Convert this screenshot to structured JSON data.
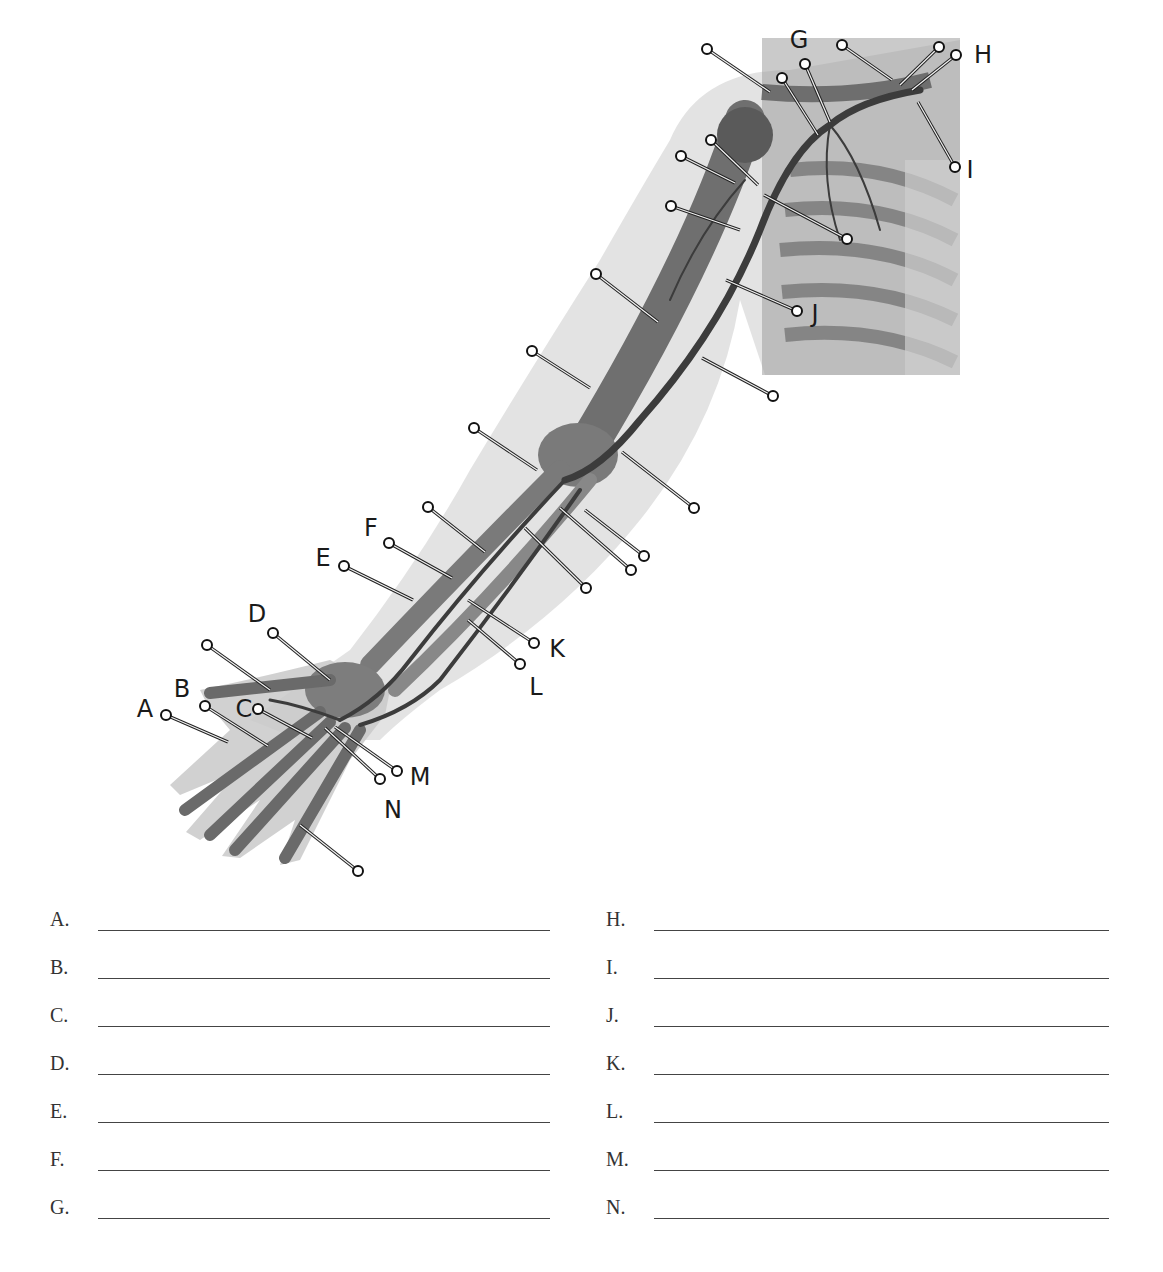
{
  "figure": {
    "callouts": [
      {
        "letter": "A",
        "label_x": 145,
        "label_y": 717,
        "pin_x": 166,
        "pin_y": 715,
        "end_x": 228,
        "end_y": 742
      },
      {
        "letter": "B",
        "label_x": 182,
        "label_y": 697,
        "pin_x": 205,
        "pin_y": 706,
        "end_x": 268,
        "end_y": 746
      },
      {
        "letter": "C",
        "label_x": 244,
        "label_y": 717,
        "pin_x": 258,
        "pin_y": 709,
        "end_x": 312,
        "end_y": 738
      },
      {
        "letter": "D",
        "label_x": 257,
        "label_y": 622,
        "pin_x": 273,
        "pin_y": 633,
        "end_x": 330,
        "end_y": 680
      },
      {
        "letter": "E",
        "label_x": 323,
        "label_y": 566,
        "pin_x": 344,
        "pin_y": 566,
        "end_x": 413,
        "end_y": 600
      },
      {
        "letter": "F",
        "label_x": 371,
        "label_y": 536,
        "pin_x": 389,
        "pin_y": 543,
        "end_x": 452,
        "end_y": 578
      },
      {
        "letter": "G",
        "label_x": 799,
        "label_y": 48,
        "pin_x": 805,
        "pin_y": 64,
        "end_x": 830,
        "end_y": 122
      },
      {
        "letter": "H",
        "label_x": 983,
        "label_y": 63,
        "pin_x": 956,
        "pin_y": 55,
        "end_x": 912,
        "end_y": 90
      },
      {
        "letter": "I",
        "label_x": 970,
        "label_y": 178,
        "pin_x": 955,
        "pin_y": 167,
        "end_x": 918,
        "end_y": 102
      },
      {
        "letter": "J",
        "label_x": 815,
        "label_y": 322,
        "pin_x": 797,
        "pin_y": 311,
        "end_x": 726,
        "end_y": 280
      },
      {
        "letter": "K",
        "label_x": 557,
        "label_y": 657,
        "pin_x": 534,
        "pin_y": 643,
        "end_x": 468,
        "end_y": 600
      },
      {
        "letter": "L",
        "label_x": 536,
        "label_y": 695,
        "pin_x": 520,
        "pin_y": 664,
        "end_x": 468,
        "end_y": 620
      },
      {
        "letter": "M",
        "label_x": 420,
        "label_y": 785,
        "pin_x": 397,
        "pin_y": 771,
        "end_x": 335,
        "end_y": 727
      },
      {
        "letter": "N",
        "label_x": 393,
        "label_y": 818,
        "pin_x": 380,
        "pin_y": 779,
        "end_x": 325,
        "end_y": 728
      }
    ],
    "unlabeled_pins": [
      {
        "pin_x": 707,
        "pin_y": 49,
        "end_x": 770,
        "end_y": 92
      },
      {
        "pin_x": 782,
        "pin_y": 78,
        "end_x": 818,
        "end_y": 135
      },
      {
        "pin_x": 842,
        "pin_y": 45,
        "end_x": 892,
        "end_y": 80
      },
      {
        "pin_x": 939,
        "pin_y": 47,
        "end_x": 900,
        "end_y": 85
      },
      {
        "pin_x": 711,
        "pin_y": 140,
        "end_x": 758,
        "end_y": 185
      },
      {
        "pin_x": 681,
        "pin_y": 156,
        "end_x": 735,
        "end_y": 183
      },
      {
        "pin_x": 847,
        "pin_y": 239,
        "end_x": 764,
        "end_y": 195
      },
      {
        "pin_x": 671,
        "pin_y": 206,
        "end_x": 740,
        "end_y": 230
      },
      {
        "pin_x": 596,
        "pin_y": 274,
        "end_x": 658,
        "end_y": 322
      },
      {
        "pin_x": 773,
        "pin_y": 396,
        "end_x": 702,
        "end_y": 358
      },
      {
        "pin_x": 532,
        "pin_y": 351,
        "end_x": 590,
        "end_y": 388
      },
      {
        "pin_x": 474,
        "pin_y": 428,
        "end_x": 537,
        "end_y": 470
      },
      {
        "pin_x": 694,
        "pin_y": 508,
        "end_x": 622,
        "end_y": 452
      },
      {
        "pin_x": 428,
        "pin_y": 507,
        "end_x": 485,
        "end_y": 552
      },
      {
        "pin_x": 644,
        "pin_y": 556,
        "end_x": 585,
        "end_y": 510
      },
      {
        "pin_x": 631,
        "pin_y": 570,
        "end_x": 560,
        "end_y": 508
      },
      {
        "pin_x": 586,
        "pin_y": 588,
        "end_x": 525,
        "end_y": 528
      },
      {
        "pin_x": 207,
        "pin_y": 645,
        "end_x": 270,
        "end_y": 690
      },
      {
        "pin_x": 358,
        "pin_y": 871,
        "end_x": 300,
        "end_y": 825
      }
    ]
  },
  "answers": {
    "left": [
      {
        "letter": "A.",
        "value": ""
      },
      {
        "letter": "B.",
        "value": ""
      },
      {
        "letter": "C.",
        "value": ""
      },
      {
        "letter": "D.",
        "value": ""
      },
      {
        "letter": "E.",
        "value": ""
      },
      {
        "letter": "F.",
        "value": ""
      },
      {
        "letter": "G.",
        "value": ""
      }
    ],
    "right": [
      {
        "letter": "H.",
        "value": ""
      },
      {
        "letter": "I.",
        "value": ""
      },
      {
        "letter": "J.",
        "value": ""
      },
      {
        "letter": "K.",
        "value": ""
      },
      {
        "letter": "L.",
        "value": ""
      },
      {
        "letter": "M.",
        "value": ""
      },
      {
        "letter": "N.",
        "value": ""
      }
    ]
  }
}
